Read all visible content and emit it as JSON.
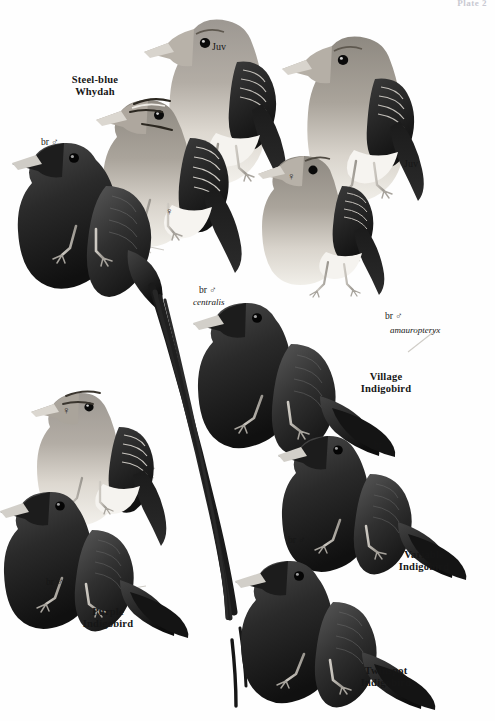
{
  "plate": {
    "number_label": "Plate 2",
    "page_background": "#ffffff",
    "ink_color": "#161616"
  },
  "species_labels": [
    {
      "id": "steel-blue-whydah",
      "line1": "Steel-blue",
      "line2": "Whydah",
      "x": 52,
      "y": 74
    },
    {
      "id": "village-indigobird",
      "line1": "Village",
      "line2": "Indigobird",
      "x": 363,
      "y": 371
    },
    {
      "id": "variable-indigobird",
      "line1": "Variable",
      "line2": "Indigobird",
      "x": 383,
      "y": 549
    },
    {
      "id": "twinspot-indigobird",
      "line1": "Twinspot",
      "line2": "Indigobird",
      "x": 359,
      "y": 665
    },
    {
      "id": "purple-indigobird",
      "line1": "Purple",
      "line2": "Indigobird",
      "x": 87,
      "y": 606
    }
  ],
  "annotations": [
    {
      "id": "whydah-br-male",
      "text": "br ♂",
      "x": 41,
      "y": 137,
      "kind": "tag"
    },
    {
      "id": "whydah-juv-left",
      "text": "Juv",
      "x": 212,
      "y": 41,
      "kind": "juv"
    },
    {
      "id": "whydah-juv-right",
      "text": "Juv",
      "x": 404,
      "y": 158,
      "kind": "juv"
    },
    {
      "id": "whydah-female-mid",
      "text": "♀",
      "x": 165,
      "y": 207,
      "kind": "sym"
    },
    {
      "id": "whydah-female-right",
      "text": "♀",
      "x": 287,
      "y": 172,
      "kind": "sym"
    },
    {
      "id": "indigobird-female-left",
      "text": "♀",
      "x": 62,
      "y": 405,
      "kind": "sym"
    },
    {
      "id": "village-br-male-centralis",
      "text": "br ♂",
      "x": 199,
      "y": 285,
      "kind": "tag"
    },
    {
      "id": "village-centralis-sci",
      "text": "centralis",
      "x": 196,
      "y": 296,
      "kind": "sci"
    },
    {
      "id": "village-br-male-amauropteryx",
      "text": "br ♂",
      "x": 385,
      "y": 313,
      "kind": "tag"
    },
    {
      "id": "village-amauropteryx-sci",
      "text": "amauropteryx",
      "x": 390,
      "y": 326,
      "kind": "sci"
    },
    {
      "id": "variable-br-male",
      "text": "br ♂",
      "x": 374,
      "y": 440,
      "kind": "tag"
    },
    {
      "id": "twinspot-br-male",
      "text": "br ♂",
      "x": 288,
      "y": 535,
      "kind": "tag"
    },
    {
      "id": "purple-br-male",
      "text": "br ♂",
      "x": 46,
      "y": 578,
      "kind": "tag"
    }
  ],
  "figures": [
    {
      "id": "juv-whydah-left",
      "name": "juvenile-whydah-left",
      "plumage": "grey-brown-pale-belly"
    },
    {
      "id": "juv-whydah-right",
      "name": "juvenile-whydah-right",
      "plumage": "grey-brown-pale-belly"
    },
    {
      "id": "female-whydah-right",
      "name": "female-whydah-right",
      "plumage": "buff-streaked"
    },
    {
      "id": "female-whydah-mid",
      "name": "female-whydah-striped-head",
      "plumage": "streaked-crown"
    },
    {
      "id": "male-steel-blue-whydah",
      "name": "breeding-male-steel-blue-whydah",
      "plumage": "blue-black-long-tail"
    },
    {
      "id": "female-indigobird-left",
      "name": "female-indigobird-left",
      "plumage": "buff-streaked"
    },
    {
      "id": "male-purple-indigobird",
      "name": "breeding-male-purple-indigobird",
      "plumage": "glossy-dark"
    },
    {
      "id": "male-village-centralis",
      "name": "breeding-male-village-indigobird-centralis",
      "plumage": "glossy-dark"
    },
    {
      "id": "male-variable-indigobird",
      "name": "breeding-male-variable-indigobird",
      "plumage": "glossy-dark"
    },
    {
      "id": "male-twinspot-indigobird",
      "name": "breeding-male-twinspot-indigobird",
      "plumage": "glossy-dark"
    }
  ]
}
